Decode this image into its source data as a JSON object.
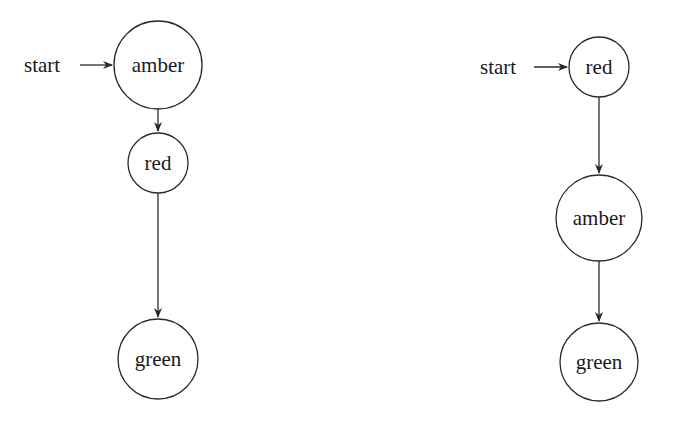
{
  "diagrams": [
    {
      "name": "left-state-machine",
      "start_label": "start",
      "states": [
        {
          "id": "amber",
          "label": "amber",
          "cx": 158,
          "cy": 65,
          "r": 44
        },
        {
          "id": "red",
          "label": "red",
          "cx": 158,
          "cy": 163,
          "r": 30
        },
        {
          "id": "green",
          "label": "green",
          "cx": 158,
          "cy": 359,
          "r": 40
        }
      ],
      "start_state": "amber",
      "transitions": [
        {
          "from": "amber",
          "to": "red"
        },
        {
          "from": "red",
          "to": "green"
        }
      ]
    },
    {
      "name": "right-state-machine",
      "start_label": "start",
      "states": [
        {
          "id": "red",
          "label": "red",
          "cx": 599,
          "cy": 67,
          "r": 30
        },
        {
          "id": "amber",
          "label": "amber",
          "cx": 599,
          "cy": 218,
          "r": 43
        },
        {
          "id": "green",
          "label": "green",
          "cx": 599,
          "cy": 362,
          "r": 39
        }
      ],
      "start_state": "red",
      "transitions": [
        {
          "from": "red",
          "to": "amber"
        },
        {
          "from": "amber",
          "to": "green"
        }
      ]
    }
  ],
  "colors": {
    "stroke": "#2a2a2a",
    "text": "#1a1a1a",
    "background": "#ffffff"
  }
}
